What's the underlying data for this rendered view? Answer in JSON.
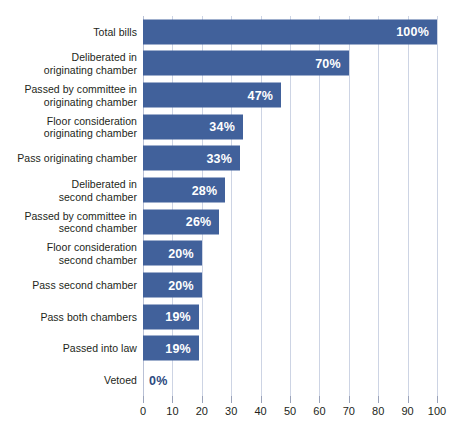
{
  "chart_data": {
    "type": "bar",
    "orientation": "horizontal",
    "title": "",
    "subtitle": "",
    "xlabel": "",
    "ylabel": "",
    "xlim": [
      0,
      100
    ],
    "grid": true,
    "legend": false,
    "value_suffix": "%",
    "bar_color": "#41619b",
    "gridline_color": "#cdd4e4",
    "label_color": "#231f20",
    "inside_label_color": "#ffffff",
    "outside_label_color": "#2d4a80",
    "xticks": [
      0,
      10,
      20,
      30,
      40,
      50,
      60,
      70,
      80,
      90,
      100
    ],
    "xtick_labels": [
      "0",
      "10",
      "20",
      "30",
      "40",
      "50",
      "60",
      "70",
      "80",
      "90",
      "100"
    ],
    "categories": [
      "Total bills",
      "Deliberated in\noriginating chamber",
      "Passed by committee in\noriginating chamber",
      "Floor consideration\noriginating chamber",
      "Pass originating chamber",
      "Deliberated in\nsecond chamber",
      "Passed by committee in\nsecond chamber",
      "Floor consideration\nsecond chamber",
      "Pass second chamber",
      "Pass both chambers",
      "Passed into law",
      "Vetoed"
    ],
    "values": [
      100,
      70,
      47,
      34,
      33,
      28,
      26,
      20,
      20,
      19,
      19,
      0
    ],
    "data_labels": [
      "100%",
      "70%",
      "47%",
      "34%",
      "33%",
      "28%",
      "26%",
      "20%",
      "20%",
      "19%",
      "19%",
      "0%"
    ]
  }
}
